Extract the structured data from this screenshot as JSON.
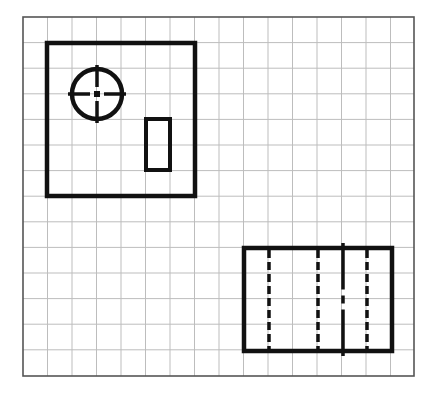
{
  "diagram": {
    "type": "orthographic-drawing-on-grid",
    "canvas": {
      "width": 438,
      "height": 393,
      "background": "#ffffff"
    },
    "grid": {
      "x0": 23,
      "y0": 17,
      "x1": 414,
      "y1": 376,
      "cell_w": 24.5,
      "cell_h": 25.6,
      "columns": 16,
      "rows": 14,
      "line_color": "#bdbdbd",
      "border_color": "#555555"
    },
    "stroke_color": "#111111",
    "views": [
      {
        "name": "top-view",
        "outline": {
          "x": 47,
          "y": 43,
          "w": 148,
          "h": 153
        },
        "circle": {
          "cx": 97,
          "cy": 94,
          "r": 25,
          "centerlines": {
            "h": [
              68,
              126
            ],
            "v": [
              65,
              123
            ]
          }
        },
        "slot": {
          "x": 146,
          "y": 119,
          "w": 24,
          "h": 51
        }
      },
      {
        "name": "front-view",
        "outline": {
          "x": 244,
          "y": 248,
          "w": 148,
          "h": 103
        },
        "hidden_lines_x": [
          269,
          318,
          367
        ],
        "center_line": {
          "x": 343,
          "y_top": 243,
          "y_bottom": 356
        }
      }
    ]
  }
}
